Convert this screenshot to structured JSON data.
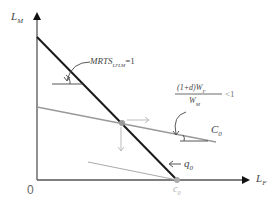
{
  "diagram": {
    "axes": {
      "y_label": "L",
      "y_label_sub": "M",
      "x_label": "L",
      "x_label_sub": "F",
      "origin_label": "0"
    },
    "annotations": {
      "mrts_main": "MRTS",
      "mrts_sub": "LFLM",
      "mrts_rhs": "=1",
      "ratio_numerator": "(1+d)W",
      "ratio_numerator_sub": "F",
      "ratio_denominator": "W",
      "ratio_denominator_sub": "M",
      "ratio_rhs": "<1",
      "cost_line_label": "C",
      "cost_line_sub": "0",
      "isoquant_label": "q",
      "isoquant_sub": "0",
      "corner_label": "c",
      "corner_sub": "0"
    },
    "colors": {
      "isoquant": "#1a1a1a",
      "cost_line": "#999999",
      "axis": "#555555",
      "arrow": "#bbbbbb"
    }
  }
}
